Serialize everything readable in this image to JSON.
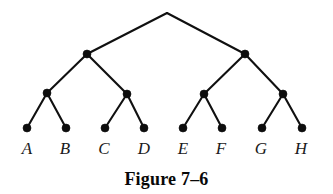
{
  "figure": {
    "caption": "Figure 7–6",
    "type": "binary-tree-diagram",
    "background_color": "#ffffff",
    "ink_color": "#0d0d0d",
    "width": 333,
    "height": 194
  },
  "tree": {
    "levels": 4,
    "node_radius": 4.0,
    "root": {
      "id": "root",
      "x": 167,
      "y": 13,
      "visible_dot": false
    },
    "level1": [
      {
        "id": "n1L",
        "x": 87,
        "y": 54,
        "visible_dot": true
      },
      {
        "id": "n1R",
        "x": 245,
        "y": 54,
        "visible_dot": true
      }
    ],
    "level2": [
      {
        "id": "n2a",
        "x": 47,
        "y": 93,
        "visible_dot": true
      },
      {
        "id": "n2b",
        "x": 127,
        "y": 94,
        "visible_dot": true
      },
      {
        "id": "n2c",
        "x": 204,
        "y": 94,
        "visible_dot": true
      },
      {
        "id": "n2d",
        "x": 283,
        "y": 94,
        "visible_dot": true
      }
    ],
    "leaves": [
      {
        "id": "leafA",
        "label": "A",
        "x": 27,
        "y": 128,
        "label_x": 27,
        "label_y": 140
      },
      {
        "id": "leafB",
        "label": "B",
        "x": 66,
        "y": 128,
        "label_x": 65,
        "label_y": 140
      },
      {
        "id": "leafC",
        "label": "C",
        "x": 105,
        "y": 128,
        "label_x": 104,
        "label_y": 140
      },
      {
        "id": "leafD",
        "label": "D",
        "x": 144,
        "y": 128,
        "label_x": 144,
        "label_y": 140
      },
      {
        "id": "leafE",
        "label": "E",
        "x": 183,
        "y": 128,
        "label_x": 183,
        "label_y": 140
      },
      {
        "id": "leafF",
        "label": "F",
        "x": 222,
        "y": 128,
        "label_x": 221,
        "label_y": 140
      },
      {
        "id": "leafG",
        "label": "G",
        "x": 262,
        "y": 128,
        "label_x": 261,
        "label_y": 140
      },
      {
        "id": "leafH",
        "label": "H",
        "x": 302,
        "y": 128,
        "label_x": 301,
        "label_y": 140
      }
    ],
    "edges": [
      {
        "from": "root",
        "to": "n1L",
        "x1": 167,
        "y1": 13,
        "x2": 87,
        "y2": 54
      },
      {
        "from": "root",
        "to": "n1R",
        "x1": 167,
        "y1": 13,
        "x2": 245,
        "y2": 54
      },
      {
        "from": "n1L",
        "to": "n2a",
        "x1": 87,
        "y1": 54,
        "x2": 47,
        "y2": 93
      },
      {
        "from": "n1L",
        "to": "n2b",
        "x1": 87,
        "y1": 54,
        "x2": 127,
        "y2": 94
      },
      {
        "from": "n1R",
        "to": "n2c",
        "x1": 245,
        "y1": 54,
        "x2": 204,
        "y2": 94
      },
      {
        "from": "n1R",
        "to": "n2d",
        "x1": 245,
        "y1": 54,
        "x2": 283,
        "y2": 94
      },
      {
        "from": "n2a",
        "to": "leafA",
        "x1": 47,
        "y1": 93,
        "x2": 27,
        "y2": 128
      },
      {
        "from": "n2a",
        "to": "leafB",
        "x1": 47,
        "y1": 93,
        "x2": 66,
        "y2": 128
      },
      {
        "from": "n2b",
        "to": "leafC",
        "x1": 127,
        "y1": 94,
        "x2": 105,
        "y2": 128
      },
      {
        "from": "n2b",
        "to": "leafD",
        "x1": 127,
        "y1": 94,
        "x2": 144,
        "y2": 128
      },
      {
        "from": "n2c",
        "to": "leafE",
        "x1": 204,
        "y1": 94,
        "x2": 183,
        "y2": 128
      },
      {
        "from": "n2c",
        "to": "leafF",
        "x1": 204,
        "y1": 94,
        "x2": 222,
        "y2": 128
      },
      {
        "from": "n2d",
        "to": "leafG",
        "x1": 283,
        "y1": 94,
        "x2": 262,
        "y2": 128
      },
      {
        "from": "n2d",
        "to": "leafH",
        "x1": 283,
        "y1": 94,
        "x2": 302,
        "y2": 128
      }
    ]
  }
}
